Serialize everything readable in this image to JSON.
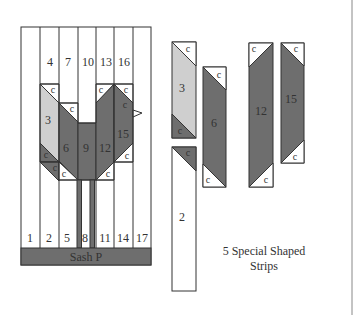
{
  "colors": {
    "dark": "#6e6e6e",
    "light": "#cfcfcf",
    "mid_dark": "#5a5a5a",
    "background": "#ffffff",
    "line": "#333333"
  },
  "quilt": {
    "column_labels_top": [
      "4",
      "7",
      "10",
      "13",
      "16"
    ],
    "body_labels": [
      "3",
      "6",
      "9",
      "12",
      "15"
    ],
    "column_labels_bottom": [
      "1",
      "2",
      "5",
      "8",
      "11",
      "14",
      "17"
    ],
    "corner_label": "c",
    "sash_label": "Sash P"
  },
  "strips": {
    "items": [
      {
        "id": "3",
        "label": "3"
      },
      {
        "id": "6",
        "label": "6"
      },
      {
        "id": "12",
        "label": "12"
      },
      {
        "id": "15",
        "label": "15"
      },
      {
        "id": "2",
        "label": "2"
      }
    ],
    "corner_label": "c",
    "caption_line1": "5 Special Shaped",
    "caption_line2": "Strips"
  }
}
